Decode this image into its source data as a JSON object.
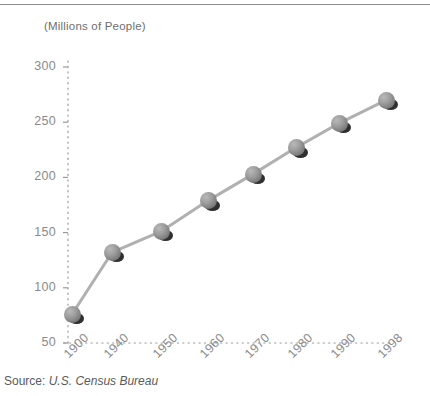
{
  "chart_data": {
    "type": "line",
    "title": "(Millions of People)",
    "subtitle": "",
    "xlabel": "",
    "ylabel": "",
    "categories": [
      "1900",
      "1940",
      "1950",
      "1960",
      "1970",
      "1980",
      "1990",
      "1998"
    ],
    "values": [
      76,
      132,
      151,
      179,
      203,
      227,
      249,
      270
    ],
    "series": [
      {
        "name": "U.S. Population",
        "values": [
          76,
          132,
          151,
          179,
          203,
          227,
          249,
          270
        ]
      }
    ],
    "ylim": [
      50,
      300
    ],
    "yticks": [
      50,
      100,
      150,
      200,
      250,
      300
    ],
    "ytick_labels": [
      "50",
      "100",
      "150",
      "200",
      "250",
      "300"
    ],
    "xtick_labels": [
      "1900",
      "1940",
      "1950",
      "1960",
      "1970",
      "1980",
      "1990",
      "1998"
    ],
    "grid": false,
    "legend": "none",
    "axis_style": "dotted",
    "marker_style": "3d-sphere-with-shadow",
    "line_color": "#b0b0b0",
    "marker_color": "#8e8e8e",
    "shadow_color": "#1d1d1d",
    "axis_color": "#9a9a9a",
    "text_color": "#8a8a8a",
    "annotations": []
  },
  "source": {
    "label": "Source:",
    "value": "U.S. Census Bureau"
  },
  "colors": {
    "background": "#ffffff",
    "rule": "#8e8e8e",
    "title_text": "#6e6e6e",
    "source_text": "#5a5a5a"
  }
}
